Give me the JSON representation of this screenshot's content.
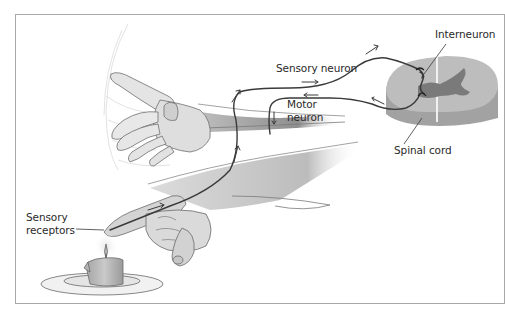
{
  "figure": {
    "type": "reflex-arc-illustration",
    "labels": {
      "interneuron": "Interneuron",
      "sensory_neuron": "Sensory neuron",
      "motor_neuron_line1": "Motor",
      "motor_neuron_line2": "neuron",
      "spinal_cord": "Spinal cord",
      "sensory_receptors_line1": "Sensory",
      "sensory_receptors_line2": "receptors"
    },
    "colors": {
      "frame": "#a8a8a8",
      "neuron": "#3a3a3a",
      "spinal_white_matter": "#b9b9b9",
      "spinal_grey_matter": "#7c7c7c",
      "spinal_side": "#9d9d9d",
      "skin_shade": "#8a8a8a",
      "text": "#2a2a2a"
    },
    "elements": [
      "withdrawn-hand",
      "hand-over-candle",
      "candle-on-plate",
      "spinal-cord-cross-section",
      "sensory-neuron-path",
      "motor-neuron-path",
      "interneuron-synapse"
    ]
  }
}
